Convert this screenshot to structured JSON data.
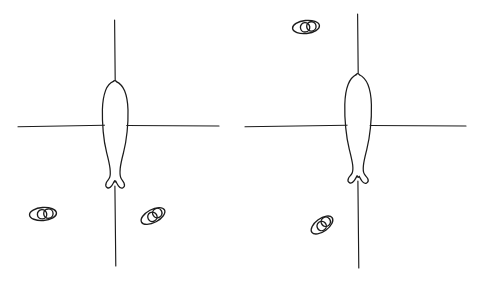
{
  "figure": {
    "title": "",
    "background_color": "#ffffff",
    "ink_color": "#1c1c1c",
    "width": 482,
    "height": 286,
    "panel_count": 2
  },
  "panels": [
    {
      "id": "left-panel",
      "label": "",
      "crosshair": {
        "vertical": {
          "x": 115,
          "y1": 20,
          "y2": 266
        },
        "horizontal": {
          "y": 126,
          "x1": 18,
          "x2": 219
        }
      },
      "specimen": {
        "name": "fish-outline",
        "orientation": "head-up",
        "head_y": 81,
        "tail_y": 188,
        "max_width": 28,
        "center_x": 115
      },
      "marks": [
        {
          "name": "egg-pair-lower-left",
          "cx": 43,
          "cy": 214,
          "rx": 13.5,
          "ry": 6.5,
          "rotation": -4
        },
        {
          "name": "egg-pair-lower-right",
          "cx": 153,
          "cy": 216,
          "rx": 13.0,
          "ry": 6.5,
          "rotation": -28
        }
      ]
    },
    {
      "id": "right-panel",
      "label": "",
      "crosshair": {
        "vertical": {
          "x": 358,
          "y1": 14,
          "y2": 268
        },
        "horizontal": {
          "y": 126,
          "x1": 245,
          "x2": 466
        }
      },
      "specimen": {
        "name": "fish-outline",
        "orientation": "head-up",
        "head_y": 74,
        "tail_y": 183,
        "max_width": 29,
        "center_x": 358
      },
      "marks": [
        {
          "name": "egg-pair-upper-left",
          "cx": 306,
          "cy": 27,
          "rx": 13.5,
          "ry": 6.5,
          "rotation": -6
        },
        {
          "name": "egg-pair-lower-left",
          "cx": 322,
          "cy": 225,
          "rx": 12.5,
          "ry": 6.5,
          "rotation": -36
        }
      ]
    }
  ],
  "legend": {
    "items": []
  }
}
